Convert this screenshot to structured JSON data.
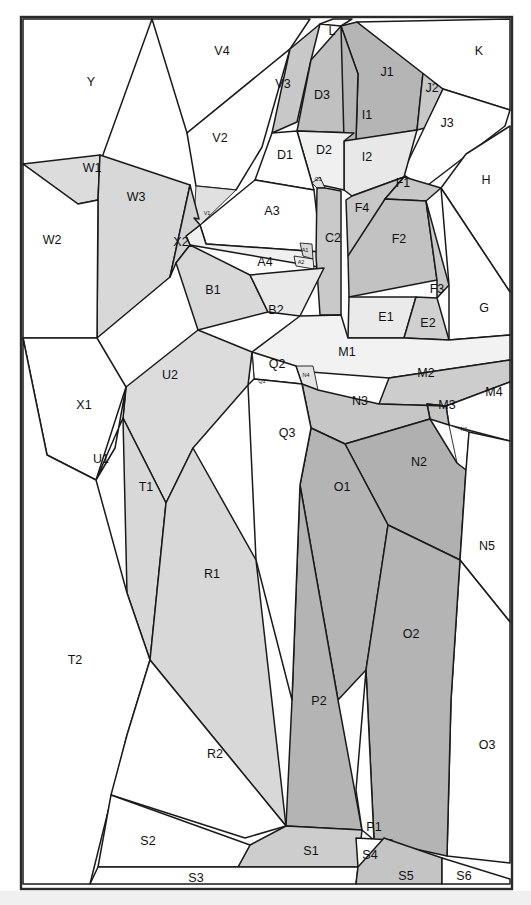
{
  "figure": {
    "title": "",
    "type": "region-partition-diagram",
    "width": 531,
    "height": 905,
    "frame": {
      "x": 21,
      "y": 17,
      "width": 491,
      "height": 872,
      "stroke": "#2a2a2a"
    }
  },
  "palette": {
    "white": "#ffffff",
    "very_light": "#f1f1f1",
    "light": "#e4e4e4",
    "mid_light": "#d6d6d6",
    "mid": "#c8c8c8",
    "dark": "#b3b3b3",
    "darker": "#a0a0a0",
    "line": "#1a1a1a",
    "text": "#111111"
  },
  "regions": [
    {
      "id": "Y",
      "label": "Y",
      "fill": "#ffffff",
      "lx": 91,
      "ly": 83,
      "size": "normal",
      "points": "23,19 152,19 96,174 23,164"
    },
    {
      "id": "V4",
      "label": "V4",
      "fill": "#ffffff",
      "lx": 222,
      "ly": 52,
      "size": "normal",
      "points": "152,19 310,19 290,49 187,133"
    },
    {
      "id": "V2",
      "label": "V2",
      "fill": "#ffffff",
      "lx": 220,
      "ly": 139,
      "size": "normal",
      "points": "187,133 290,49 262,147 236,190 196,186"
    },
    {
      "id": "V3",
      "label": "V3",
      "fill": "#c8c8c8",
      "lx": 283,
      "ly": 85,
      "size": "normal",
      "points": "290,49 320,24 311,60 297,122 272,133"
    },
    {
      "id": "L",
      "label": "L",
      "fill": "#ffffff",
      "lx": 332,
      "ly": 32,
      "size": "normal",
      "points": "320,24 333,19 352,19 341,26"
    },
    {
      "id": "D3",
      "label": "D3",
      "fill": "#c0c0c0",
      "lx": 322,
      "ly": 96,
      "size": "normal",
      "points": "311,60 341,26 358,74 354,133 297,131"
    },
    {
      "id": "J1",
      "label": "J1",
      "fill": "#b5b5b5",
      "lx": 387,
      "ly": 73,
      "size": "normal",
      "points": "341,26 357,22 423,73 417,130 356,140 358,74"
    },
    {
      "id": "J2",
      "label": "J2",
      "fill": "#c8c8c8",
      "lx": 432,
      "ly": 89,
      "size": "normal",
      "points": "423,73 443,89 425,128 417,130"
    },
    {
      "id": "K",
      "label": "K",
      "fill": "#ffffff",
      "lx": 479,
      "ly": 52,
      "size": "normal",
      "points": "357,22 510,19 510,110 443,89"
    },
    {
      "id": "J3",
      "label": "J3",
      "fill": "#ffffff",
      "lx": 447,
      "ly": 124,
      "size": "normal",
      "points": "443,89 510,110 505,126 424,188 402,174"
    },
    {
      "id": "H",
      "label": "H",
      "fill": "#ffffff",
      "lx": 486,
      "ly": 181,
      "size": "normal",
      "points": "510,126 510,292 441,188 466,154"
    },
    {
      "id": "I1",
      "label": "I1",
      "fill": "#b5b5b5",
      "lx": 367,
      "ly": 116,
      "size": "normal",
      "points": "341,26 358,74 356,140 344,141"
    },
    {
      "id": "I2",
      "label": "I2",
      "fill": "#e8e8e8",
      "lx": 367,
      "ly": 158,
      "size": "normal",
      "points": "344,141 417,130 404,177 352,196 344,190"
    },
    {
      "id": "D2",
      "label": "D2",
      "fill": "#f0f0f0",
      "lx": 324,
      "ly": 151,
      "size": "normal",
      "points": "297,131 354,133 344,141 344,190 312,183"
    },
    {
      "id": "D1",
      "label": "D1",
      "fill": "#ffffff",
      "lx": 285,
      "ly": 156,
      "size": "normal",
      "points": "272,133 297,131 312,183 314,190 255,180"
    },
    {
      "id": "C1",
      "label": "C1",
      "fill": "#dfdfdf",
      "lx": 318,
      "ly": 180,
      "size": "tiny",
      "points": "312,183 320,177 325,188 317,188"
    },
    {
      "id": "A3",
      "label": "A3",
      "fill": "#ffffff",
      "lx": 272,
      "ly": 212,
      "size": "normal",
      "points": "255,180 314,190 321,252 206,244 200,225"
    },
    {
      "id": "V1",
      "label": "V1",
      "fill": "#e0e0e0",
      "lx": 207,
      "ly": 214,
      "size": "tiny",
      "points": "196,186 236,190 200,225 194,218"
    },
    {
      "id": "A4",
      "label": "A4",
      "fill": "#f0f0f0",
      "lx": 265,
      "ly": 263,
      "size": "normal",
      "points": "200,225 206,244 321,252 324,268 190,245 186,236"
    },
    {
      "id": "A1",
      "label": "A1",
      "fill": "#d8d8d8",
      "lx": 305,
      "ly": 251,
      "size": "tiny",
      "points": "300,243 312,244 313,259 303,256"
    },
    {
      "id": "A2",
      "label": "A2",
      "fill": "#ececec",
      "lx": 301,
      "ly": 263,
      "size": "tiny",
      "points": "294,256 313,259 314,269 296,266"
    },
    {
      "id": "C2",
      "label": "C2",
      "fill": "#c9c9c9",
      "lx": 333,
      "ly": 239,
      "size": "normal",
      "points": "317,188 325,188 341,191 341,315 320,315 316,256"
    },
    {
      "id": "F4",
      "label": "F4",
      "fill": "#c8c8c8",
      "lx": 362,
      "ly": 209,
      "size": "normal",
      "points": "352,196 404,177 385,199 354,259 348,256 346,200"
    },
    {
      "id": "F1",
      "label": "F1",
      "fill": "#c8c8c8",
      "lx": 403,
      "ly": 184,
      "size": "normal",
      "points": "404,177 441,188 426,201 385,199"
    },
    {
      "id": "F2",
      "label": "F2",
      "fill": "#c2c2c2",
      "lx": 399,
      "ly": 240,
      "size": "normal",
      "points": "385,199 426,201 437,280 349,297 348,256"
    },
    {
      "id": "F3",
      "label": "F3",
      "fill": "#c8c8c8",
      "lx": 437,
      "ly": 290,
      "size": "normal",
      "points": "426,201 449,285 437,298 437,280"
    },
    {
      "id": "G",
      "label": "G",
      "fill": "#ffffff",
      "lx": 484,
      "ly": 309,
      "size": "normal",
      "points": "441,188 510,292 510,335 449,340 449,285"
    },
    {
      "id": "E1",
      "label": "E1",
      "fill": "#eaeaea",
      "lx": 386,
      "ly": 318,
      "size": "normal",
      "points": "349,297 416,297 404,338 348,338"
    },
    {
      "id": "E2",
      "label": "E2",
      "fill": "#d0d0d0",
      "lx": 428,
      "ly": 324,
      "size": "normal",
      "points": "416,297 437,298 449,340 404,338"
    },
    {
      "id": "W1",
      "label": "W1",
      "fill": "#dcdcdc",
      "lx": 92,
      "ly": 169,
      "size": "normal",
      "points": "23,164 100,155 98,200 78,204"
    },
    {
      "id": "W3",
      "label": "W3",
      "fill": "#d8d8d8",
      "lx": 136,
      "ly": 198,
      "size": "normal",
      "points": "100,155 190,185 170,277 97,338 98,200"
    },
    {
      "id": "W2",
      "label": "W2",
      "fill": "#ffffff",
      "lx": 52,
      "ly": 241,
      "size": "normal",
      "points": "23,164 78,204 98,200 97,338 23,338"
    },
    {
      "id": "X2",
      "label": "X2",
      "fill": "#d2d2d2",
      "lx": 181,
      "ly": 243,
      "size": "normal",
      "points": "190,185 199,219 194,218 200,225 186,236 190,245 176,263 170,277"
    },
    {
      "id": "B1",
      "label": "B1",
      "fill": "#d8d8d8",
      "lx": 213,
      "ly": 291,
      "size": "normal",
      "points": "190,245 250,275 268,312 198,330 176,263"
    },
    {
      "id": "B2",
      "label": "B2",
      "fill": "#e9e9e9",
      "lx": 276,
      "ly": 311,
      "size": "normal",
      "points": "250,275 324,268 300,316 268,312"
    },
    {
      "id": "M1",
      "label": "M1",
      "fill": "#f2f2f2",
      "lx": 347,
      "ly": 353,
      "size": "normal",
      "points": "300,316 341,315 348,338 404,338 449,340 510,335 510,360 389,378 258,368 252,352"
    },
    {
      "id": "M2",
      "label": "M2",
      "fill": "#cdcdcd",
      "lx": 426,
      "ly": 374,
      "size": "normal",
      "points": "389,378 510,360 510,382 446,406 379,404"
    },
    {
      "id": "M4",
      "label": "M4",
      "fill": "#ffffff",
      "lx": 494,
      "ly": 393,
      "size": "normal",
      "points": "510,382 510,441 449,425 446,406"
    },
    {
      "id": "M3",
      "label": "M3",
      "fill": "#c5c5c5",
      "lx": 447,
      "ly": 406,
      "size": "normal",
      "points": "446,406 449,425 430,419 427,404"
    },
    {
      "id": "N1",
      "label": "N1",
      "fill": "#ffffff",
      "lx": 464,
      "ly": 430,
      "size": "tiny",
      "points": "449,425 469,432 466,470 457,463"
    },
    {
      "id": "N4",
      "label": "N4",
      "fill": "#e4e4e4",
      "lx": 306,
      "ly": 376,
      "size": "tiny",
      "points": "296,366 313,366 318,390 302,384"
    },
    {
      "id": "Q2",
      "label": "Q2",
      "fill": "#ffffff",
      "lx": 277,
      "ly": 365,
      "size": "normal",
      "points": "252,352 296,366 302,384 254,379"
    },
    {
      "id": "Q1",
      "label": "Q1",
      "fill": "#ffffff",
      "lx": 262,
      "ly": 382,
      "size": "tiny",
      "points": "252,352 254,379 248,385"
    },
    {
      "id": "N3",
      "label": "N3",
      "fill": "#c6c6c6",
      "lx": 360,
      "ly": 402,
      "size": "normal",
      "points": "302,384 318,390 379,404 446,406 427,404 430,419 345,444 311,428"
    },
    {
      "id": "N2",
      "label": "N2",
      "fill": "#b0b0b0",
      "lx": 419,
      "ly": 463,
      "size": "normal",
      "points": "430,419 457,463 466,470 460,560 388,525 345,444"
    },
    {
      "id": "N5",
      "label": "N5",
      "fill": "#ffffff",
      "lx": 487,
      "ly": 547,
      "size": "normal",
      "points": "510,441 510,622 460,560 466,470 469,432"
    },
    {
      "id": "O3",
      "label": "O3",
      "fill": "#ffffff",
      "lx": 487,
      "ly": 746,
      "size": "normal",
      "points": "510,622 510,863 447,856 451,700 460,560"
    },
    {
      "id": "O1",
      "label": "O1",
      "fill": "#b4b4b4",
      "lx": 342,
      "ly": 488,
      "size": "normal",
      "points": "311,428 345,444 388,525 366,670 338,700 300,485"
    },
    {
      "id": "O2",
      "label": "O2",
      "fill": "#b4b4b4",
      "lx": 411,
      "ly": 635,
      "size": "normal",
      "points": "388,525 460,560 451,700 447,856 374,840 366,670"
    },
    {
      "id": "P2",
      "label": "P2",
      "fill": "#b4b4b4",
      "lx": 319,
      "ly": 702,
      "size": "normal",
      "points": "300,485 338,700 362,830 286,826 292,700"
    },
    {
      "id": "P1",
      "label": "P1",
      "fill": "#ffffff",
      "lx": 374,
      "ly": 828,
      "size": "normal",
      "points": "366,670 374,840 362,830 356,790"
    },
    {
      "id": "Q3",
      "label": "Q3",
      "fill": "#ffffff",
      "lx": 287,
      "ly": 434,
      "size": "normal",
      "points": "248,385 254,379 302,384 311,428 300,485 292,700 256,560"
    },
    {
      "id": "U2",
      "label": "U2",
      "fill": "#dcdcdc",
      "lx": 170,
      "ly": 376,
      "size": "normal",
      "points": "198,330 252,352 248,385 193,448 166,503 123,418 126,387"
    },
    {
      "id": "U1",
      "label": "U1",
      "fill": "#ffffff",
      "lx": 101,
      "ly": 460,
      "size": "normal",
      "points": "123,418 126,387 115,448 96,480"
    },
    {
      "id": "X1",
      "label": "X1",
      "fill": "#ffffff",
      "lx": 84,
      "ly": 406,
      "size": "normal",
      "points": "23,338 97,338 126,387 96,480 47,455"
    },
    {
      "id": "T1",
      "label": "T1",
      "fill": "#d8d8d8",
      "lx": 146,
      "ly": 488,
      "size": "normal",
      "points": "123,418 166,503 150,660 127,593"
    },
    {
      "id": "T2",
      "label": "T2",
      "fill": "#ffffff",
      "lx": 75,
      "ly": 661,
      "size": "normal",
      "points": "23,338 47,455 96,480 127,593 150,660 127,735 90,884 23,884"
    },
    {
      "id": "R1",
      "label": "R1",
      "fill": "#d8d8d8",
      "lx": 212,
      "ly": 575,
      "size": "normal",
      "points": "193,448 256,560 286,826 150,660 166,503"
    },
    {
      "id": "R2",
      "label": "R2",
      "fill": "#ffffff",
      "lx": 215,
      "ly": 755,
      "size": "normal",
      "points": "150,660 286,826 245,838 111,795 127,735"
    },
    {
      "id": "S1",
      "label": "S1",
      "fill": "#cdcdcd",
      "lx": 311,
      "ly": 852,
      "size": "normal",
      "points": "286,826 362,830 358,867 238,867 250,845"
    },
    {
      "id": "S2",
      "label": "S2",
      "fill": "#ffffff",
      "lx": 148,
      "ly": 842,
      "size": "normal",
      "points": "111,795 250,845 238,867 98,867"
    },
    {
      "id": "S3",
      "label": "S3",
      "fill": "#ffffff",
      "lx": 196,
      "ly": 879,
      "size": "normal",
      "points": "98,867 358,867 356,884 90,884"
    },
    {
      "id": "S4",
      "label": "S4",
      "fill": "#ffffff",
      "lx": 370,
      "ly": 856,
      "size": "normal",
      "points": "356,838 392,840 384,870 358,867"
    },
    {
      "id": "S5",
      "label": "S5",
      "fill": "#c4c4c4",
      "lx": 406,
      "ly": 877,
      "size": "normal",
      "points": "384,838 442,858 442,884 356,884 358,867"
    },
    {
      "id": "S6",
      "label": "S6",
      "fill": "#ffffff",
      "lx": 464,
      "ly": 877,
      "size": "normal",
      "points": "442,858 510,879 510,884 442,884"
    }
  ]
}
